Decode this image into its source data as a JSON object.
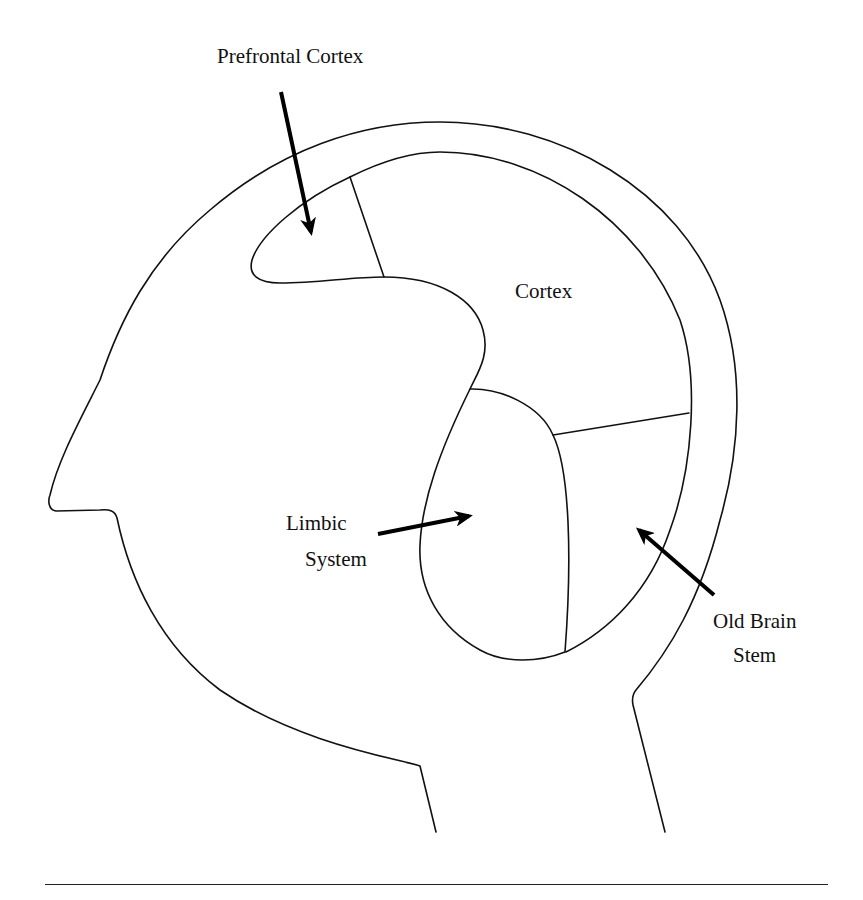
{
  "figure": {
    "labels": {
      "prefrontal_cortex": "Prefrontal Cortex",
      "cortex": "Cortex",
      "limbic_line1": "Limbic",
      "limbic_line2": "System",
      "old_brain_line1": "Old Brain",
      "old_brain_line2": "Stem"
    },
    "colors": {
      "line": "#111111",
      "background": "#ffffff"
    }
  }
}
